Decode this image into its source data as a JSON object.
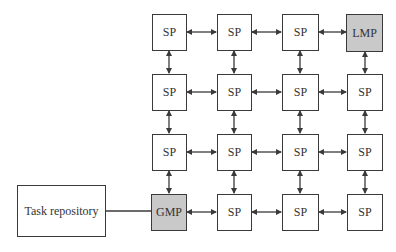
{
  "diagram": {
    "type": "mesh-network",
    "colors": {
      "node_fill": "#ffffff",
      "special_fill": "#c9c9c9",
      "stroke": "#3a3a3a"
    },
    "task_repository": {
      "label": "Task repository"
    },
    "grid": [
      [
        {
          "label": "SP"
        },
        {
          "label": "SP"
        },
        {
          "label": "SP"
        },
        {
          "label": "LMP",
          "shaded": true
        }
      ],
      [
        {
          "label": "SP"
        },
        {
          "label": "SP"
        },
        {
          "label": "SP"
        },
        {
          "label": "SP"
        }
      ],
      [
        {
          "label": "SP"
        },
        {
          "label": "SP"
        },
        {
          "label": "SP"
        },
        {
          "label": "SP"
        }
      ],
      [
        {
          "label": "GMP",
          "shaded": true
        },
        {
          "label": "SP"
        },
        {
          "label": "SP"
        },
        {
          "label": "SP"
        }
      ]
    ],
    "edges": "bidirectional arrows between all horizontally and vertically adjacent nodes; plain line from Task repository to GMP"
  }
}
